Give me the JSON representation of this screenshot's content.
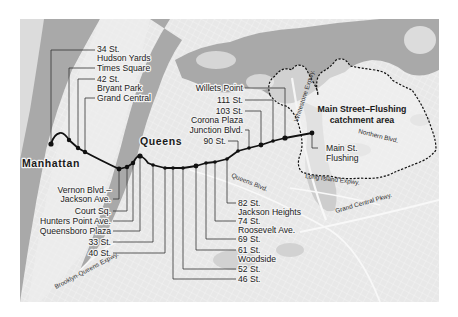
{
  "map": {
    "colors": {
      "land": "#e9e9e9",
      "land_light": "#f1f1f1",
      "water": "#a9a9a9",
      "park": "#cfcfcf",
      "route": "#111111",
      "catchment_border": "#111111"
    },
    "area_labels": {
      "manhattan": "Manhattan",
      "queens": "Queens"
    },
    "catchment": {
      "title_line1": "Main Street–Flushing",
      "title_line2": "catchment area"
    },
    "roads": {
      "whitestone": "Whitestone Expwy.",
      "northern": "Northern Blvd.",
      "long_island": "Long Island Expwy.",
      "grand_central": "Grand Central Pkwy.",
      "queens_blvd": "Queens Blvd.",
      "bqe": "Brooklyn-Queens Expwy."
    },
    "stations_top": [
      {
        "line1": "34 St.",
        "line2": "Hudson Yards"
      },
      {
        "line1": "Times Square",
        "line2": ""
      },
      {
        "line1": "42 St.",
        "line2": "Bryant Park"
      },
      {
        "line1": "Grand Central",
        "line2": ""
      }
    ],
    "stations_mid": [
      {
        "line1": "Willets Point"
      },
      {
        "line1": "111 St."
      },
      {
        "line1": "103 St."
      },
      {
        "line1": "Corona Plaza"
      },
      {
        "line1": "Junction Blvd."
      },
      {
        "line1": "90 St."
      }
    ],
    "stations_left": [
      {
        "line1": "Vernon Blvd.–",
        "line2": "Jackson Ave."
      },
      {
        "line1": "Court Sq."
      },
      {
        "line1": "Hunters Point Ave."
      },
      {
        "line1": "Queensboro Plaza"
      },
      {
        "line1": "33 St."
      },
      {
        "line1": "40 St."
      }
    ],
    "stations_right": [
      {
        "line1": "82 St.",
        "line2": "Jackson Heights"
      },
      {
        "line1": "74 St.",
        "line2": "Roosevelt Ave."
      },
      {
        "line1": "69 St."
      },
      {
        "line1": "61 St.",
        "line2": "Woodside"
      },
      {
        "line1": "52 St."
      },
      {
        "line1": "46 St."
      }
    ],
    "terminal": {
      "line1": "Main St.",
      "line2": "Flushing"
    }
  }
}
